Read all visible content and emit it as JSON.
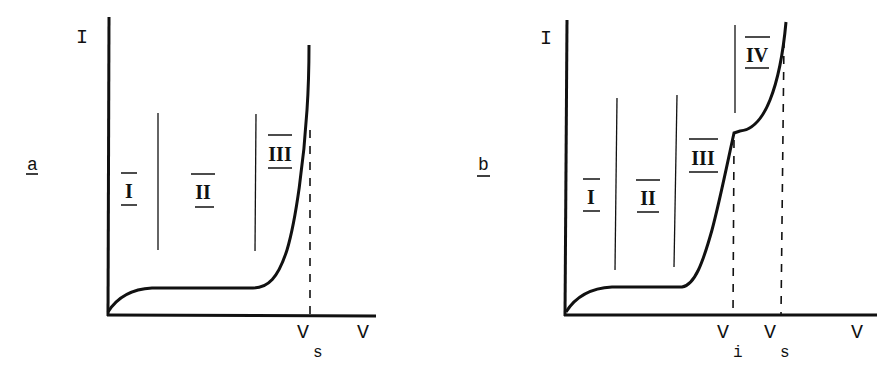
{
  "panels": [
    {
      "id": "a",
      "panel_label": "a",
      "y_axis_label": "I",
      "x_axis_label": "V",
      "markers": [
        {
          "name": "V",
          "subscript": "s"
        }
      ],
      "regions": [
        "I",
        "II",
        "III"
      ]
    },
    {
      "id": "b",
      "panel_label": "b",
      "y_axis_label": "I",
      "x_axis_label": "V",
      "markers": [
        {
          "name": "V",
          "subscript": "i"
        },
        {
          "name": "V",
          "subscript": "s"
        }
      ],
      "regions": [
        "I",
        "II",
        "III",
        "IV"
      ]
    }
  ],
  "colors": {
    "ink": "#111111",
    "background": "#ffffff"
  }
}
